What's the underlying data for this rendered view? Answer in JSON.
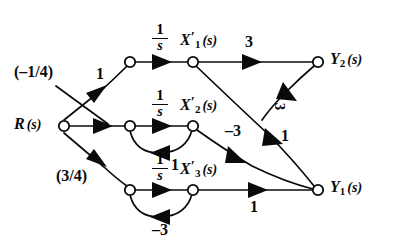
{
  "diagram": {
    "type": "signal-flow-graph",
    "nodes": [
      {
        "id": "R",
        "label_main": "R",
        "label_arg": "(s)",
        "sub": "",
        "prime": false,
        "x": 60,
        "y": 126
      },
      {
        "id": "n1",
        "label_main": "",
        "label_arg": "",
        "sub": "",
        "prime": false,
        "x": 130,
        "y": 62
      },
      {
        "id": "X1",
        "label_main": "X",
        "label_arg": "(s)",
        "sub": "1",
        "prime": true,
        "x": 193,
        "y": 62
      },
      {
        "id": "n2",
        "label_main": "",
        "label_arg": "",
        "sub": "",
        "prime": false,
        "x": 130,
        "y": 126
      },
      {
        "id": "X2",
        "label_main": "X",
        "label_arg": "(s)",
        "sub": "2",
        "prime": true,
        "x": 193,
        "y": 126
      },
      {
        "id": "n3",
        "label_main": "",
        "label_arg": "",
        "sub": "",
        "prime": false,
        "x": 130,
        "y": 190
      },
      {
        "id": "X3",
        "label_main": "X",
        "label_arg": "(s)",
        "sub": "3",
        "prime": true,
        "x": 193,
        "y": 190
      },
      {
        "id": "Y2",
        "label_main": "Y",
        "label_arg": "(s)",
        "sub": "2",
        "prime": false,
        "x": 318,
        "y": 62
      },
      {
        "id": "Y1",
        "label_main": "Y",
        "label_arg": "(s)",
        "sub": "1",
        "prime": false,
        "x": 318,
        "y": 190
      }
    ],
    "branches": [
      {
        "id": "R-n1",
        "from": "R",
        "to": "n1",
        "gain": "1",
        "note": "upper input branch"
      },
      {
        "id": "R-n2",
        "from": "R",
        "to": "n2",
        "gain": "(-1/4)",
        "note": "middle input branch, label with leader line"
      },
      {
        "id": "R-n3",
        "from": "R",
        "to": "n3",
        "gain": "(3/4)",
        "note": "lower input branch"
      },
      {
        "id": "n1-X1",
        "from": "n1",
        "to": "X1",
        "gain": "1/s",
        "note": "integrator row 1"
      },
      {
        "id": "n2-X2",
        "from": "n2",
        "to": "X2",
        "gain": "1/s",
        "note": "integrator row 2"
      },
      {
        "id": "n3-X3",
        "from": "n3",
        "to": "X3",
        "gain": "1/s",
        "note": "integrator row 3"
      },
      {
        "id": "X1-Y2",
        "from": "X1",
        "to": "Y2",
        "gain": "3",
        "note": "output branch to Y2"
      },
      {
        "id": "X1-Y1",
        "from": "X1",
        "to": "Y1",
        "gain": "1",
        "note": "crossing branch down to Y1"
      },
      {
        "id": "X2-Y1",
        "from": "X2",
        "to": "Y1",
        "gain": "-3",
        "note": "branch down to Y1"
      },
      {
        "id": "X2-n2",
        "from": "X2",
        "to": "n2",
        "gain": "1",
        "note": "feedback loop row 2"
      },
      {
        "id": "X3-Y1",
        "from": "X3",
        "to": "Y1",
        "gain": "1",
        "note": "output branch to Y1"
      },
      {
        "id": "X3-n3",
        "from": "X3",
        "to": "n3",
        "gain": "-3",
        "note": "feedback loop row 3"
      },
      {
        "id": "Y2-Y1",
        "from": "Y2",
        "to": "Y1",
        "gain": "3",
        "note": "branch from Y2 region down to Y1, rotated label"
      }
    ],
    "labels": {
      "source": {
        "main": "R",
        "arg": "(s)"
      },
      "state1": {
        "main": "X",
        "sub": "1",
        "arg": "(s)"
      },
      "state2": {
        "main": "X",
        "sub": "2",
        "arg": "(s)"
      },
      "state3": {
        "main": "X",
        "sub": "3",
        "arg": "(s)"
      },
      "out1": {
        "main": "Y",
        "sub": "1",
        "arg": "(s)"
      },
      "out2": {
        "main": "Y",
        "sub": "2",
        "arg": "(s)"
      },
      "integrator_num": "1",
      "integrator_den": "s",
      "gain_r_upper": "1",
      "gain_r_middle": "(–1/4)",
      "gain_r_lower": "(3/4)",
      "gain_x1_y2": "3",
      "gain_x1_y1": "1",
      "gain_x2_y1": "–3",
      "gain_x2_loop": "1",
      "gain_x3_y1": "1",
      "gain_x3_loop": "–3",
      "gain_y2_y1": "3"
    },
    "colors": {
      "ink": "#0a0a0a",
      "background": "#ffffff"
    }
  }
}
